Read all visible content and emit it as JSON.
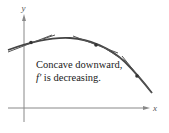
{
  "axes": {
    "x_label": "x",
    "y_label": "y"
  },
  "caption": {
    "line1": "Concave downward,",
    "line2_func": "f′",
    "line2_rest": " is decreasing."
  },
  "colors": {
    "curve": "#444444",
    "axis": "#777777",
    "text": "#1a1a1a"
  },
  "curve": {
    "description": "concave-down curve with tangent line segments",
    "points_of_tangency": [
      {
        "x": 31,
        "y": 42
      },
      {
        "x": 70,
        "y": 38
      },
      {
        "x": 96,
        "y": 45
      },
      {
        "x": 117,
        "y": 55
      },
      {
        "x": 137,
        "y": 76
      }
    ]
  }
}
